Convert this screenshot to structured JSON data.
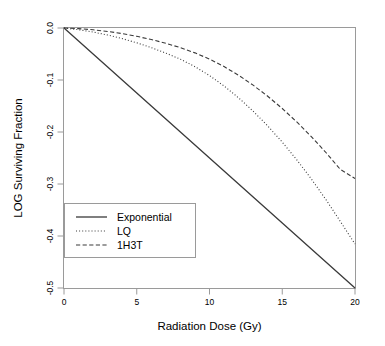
{
  "chart_data": {
    "type": "line",
    "title": "",
    "xlabel": "Radiation Dose (Gy)",
    "ylabel": "LOG Surviving Fraction",
    "xlim": [
      0,
      20
    ],
    "ylim": [
      -0.5,
      0.0
    ],
    "xticks": [
      0,
      5,
      10,
      15,
      20
    ],
    "xtick_labels": [
      "0",
      "5",
      "10",
      "15",
      "20"
    ],
    "yticks": [
      0.0,
      -0.1,
      -0.2,
      -0.3,
      -0.4,
      -0.5
    ],
    "ytick_labels": [
      "0.0",
      "-0.1",
      "-0.2",
      "-0.3",
      "-0.4",
      "-0.5"
    ],
    "grid": false,
    "legend_position": "bottom-left",
    "x": [
      0,
      1,
      2,
      3,
      4,
      5,
      6,
      7,
      8,
      9,
      10,
      11,
      12,
      13,
      14,
      15,
      16,
      17,
      18,
      19,
      20
    ],
    "series": [
      {
        "name": "Exponential",
        "style": "solid",
        "color": "#3a3a3a",
        "values": [
          0.0,
          -0.025,
          -0.05,
          -0.075,
          -0.1,
          -0.125,
          -0.15,
          -0.175,
          -0.2,
          -0.225,
          -0.25,
          -0.275,
          -0.3,
          -0.325,
          -0.35,
          -0.375,
          -0.4,
          -0.425,
          -0.45,
          -0.475,
          -0.5
        ]
      },
      {
        "name": "LQ",
        "style": "dotted",
        "color": "#3a3a3a",
        "values": [
          0.0,
          -0.0033,
          -0.0078,
          -0.0135,
          -0.0204,
          -0.0285,
          -0.0378,
          -0.0483,
          -0.06,
          -0.0743,
          -0.0915,
          -0.1115,
          -0.1343,
          -0.1599,
          -0.1883,
          -0.2195,
          -0.2535,
          -0.2903,
          -0.3299,
          -0.3723,
          -0.4155
        ]
      },
      {
        "name": "1H3T",
        "style": "dashed",
        "color": "#3a3a3a",
        "values": [
          0.0,
          -0.0012,
          -0.0034,
          -0.0066,
          -0.0108,
          -0.016,
          -0.0222,
          -0.0294,
          -0.0378,
          -0.0478,
          -0.0598,
          -0.0742,
          -0.0909,
          -0.1099,
          -0.1312,
          -0.1548,
          -0.1807,
          -0.2089,
          -0.2394,
          -0.2722,
          -0.2895
        ]
      }
    ],
    "legend_entries": [
      {
        "label": "Exponential",
        "style": "solid"
      },
      {
        "label": "LQ",
        "style": "dotted"
      },
      {
        "label": "1H3T",
        "style": "dashed"
      }
    ]
  }
}
